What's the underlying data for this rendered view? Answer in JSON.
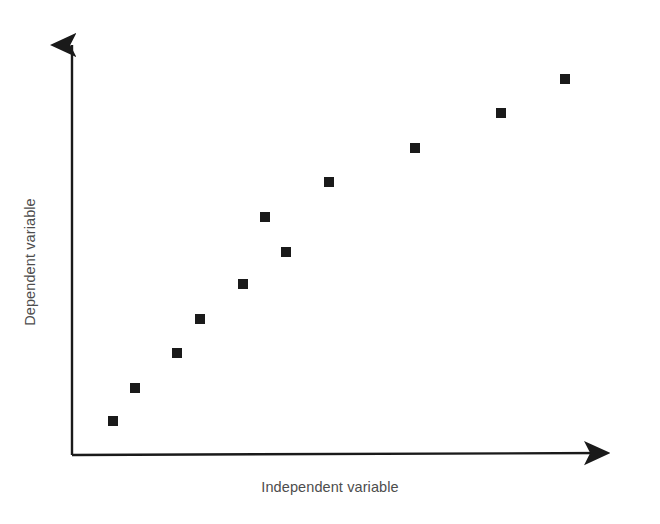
{
  "chart_data": {
    "type": "scatter",
    "title": "",
    "xlabel": "Independent variable",
    "ylabel": "Dependent variable",
    "xlim": [
      0,
      100
    ],
    "ylim": [
      0,
      100
    ],
    "grid": false,
    "legend": null,
    "axis_style": "arrow-headed open axes, no tick marks, no tick labels",
    "marker": {
      "shape": "square",
      "color": "#1a1a1a",
      "size_px": 10
    },
    "series": [
      {
        "name": "observations",
        "points": [
          {
            "label": "point-1",
            "x": 8,
            "y": 9,
            "px": 113,
            "py": 421
          },
          {
            "label": "point-2",
            "x": 15,
            "y": 17,
            "px": 135,
            "py": 388
          },
          {
            "label": "point-3",
            "x": 19,
            "y": 25,
            "px": 177,
            "py": 353
          },
          {
            "label": "point-4",
            "x": 24,
            "y": 33,
            "px": 200,
            "py": 319
          },
          {
            "label": "point-5",
            "x": 32,
            "y": 42,
            "px": 243,
            "py": 284
          },
          {
            "label": "point-6",
            "x": 36,
            "y": 58,
            "px": 265,
            "py": 217
          },
          {
            "label": "point-7",
            "x": 40,
            "y": 50,
            "px": 286,
            "py": 252
          },
          {
            "label": "point-8",
            "x": 48,
            "y": 66,
            "px": 329,
            "py": 182
          },
          {
            "label": "point-9",
            "x": 64,
            "y": 74,
            "px": 415,
            "py": 148
          },
          {
            "label": "point-10",
            "x": 78,
            "y": 82,
            "px": 501,
            "py": 113
          },
          {
            "label": "point-11",
            "x": 91,
            "y": 90,
            "px": 565,
            "py": 79
          }
        ]
      }
    ],
    "axes_geometry": {
      "origin_px": [
        72,
        455
      ],
      "y_axis_top_px": [
        72,
        33
      ],
      "x_axis_right_px": [
        620,
        455
      ],
      "line_color": "#1a1a1a",
      "line_width_px": 2.4
    }
  },
  "labels": {
    "x_axis": "Independent variable",
    "y_axis": "Dependent variable"
  },
  "colors": {
    "background": "#ffffff",
    "axis": "#1a1a1a",
    "marker": "#1a1a1a",
    "label_text": "#4d4d4d"
  }
}
